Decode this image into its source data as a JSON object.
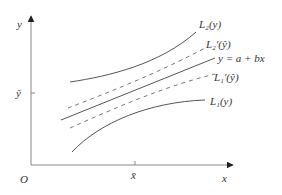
{
  "diagram": {
    "axes": {
      "x_label": "x",
      "y_label": "y",
      "origin_label": "O",
      "x_mean_label": "x̄",
      "y_mean_label": "ȳ"
    },
    "curves": [
      {
        "id": "L2",
        "label": "L₂(y)",
        "style": "solid",
        "role": "upper prediction band"
      },
      {
        "id": "L2prime",
        "label": "L₂′(ŷ)",
        "style": "dashed",
        "role": "upper confidence band"
      },
      {
        "id": "regression",
        "label": "y = a + bx",
        "style": "solid",
        "role": "regression line"
      },
      {
        "id": "L1prime",
        "label": "L₁′(ŷ)",
        "style": "dashed",
        "role": "lower confidence band"
      },
      {
        "id": "L1",
        "label": "L₁(y)",
        "style": "solid",
        "role": "lower prediction band"
      }
    ],
    "colors": {
      "axis": "#888888",
      "curve": "#555555",
      "dashed": "#777777",
      "text": "#333333"
    }
  }
}
